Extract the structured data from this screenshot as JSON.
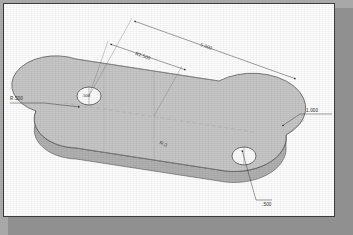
{
  "drawing": {
    "title": "Isometric slot plate detail drawing",
    "sheet_background": "#fdfdfd",
    "border_color": "#3a3a3a",
    "shadow_color": "#909090",
    "canvas_background": "#a8a8a8",
    "part_fill": "#c6c6c6",
    "part_fill_dark": "#b4b4b4",
    "part_edge": "#4a4a4a",
    "dimension_color": "#2b2b2b"
  },
  "dimensions": [
    {
      "id": "overall-length",
      "label": "5.000",
      "kind": "linear"
    },
    {
      "id": "hole-spacing",
      "label": "R2.500",
      "kind": "linear"
    },
    {
      "id": "corner-radius",
      "label": "R.500",
      "kind": "radius-leader"
    },
    {
      "id": "width",
      "label": "1.000",
      "kind": "leader"
    },
    {
      "id": "hole-diameter",
      "label": ".500",
      "kind": "leader"
    }
  ],
  "annotations": [
    {
      "id": "left-hole-callout",
      "label": ".500"
    },
    {
      "id": "face-note",
      "label": "R.0"
    }
  ]
}
